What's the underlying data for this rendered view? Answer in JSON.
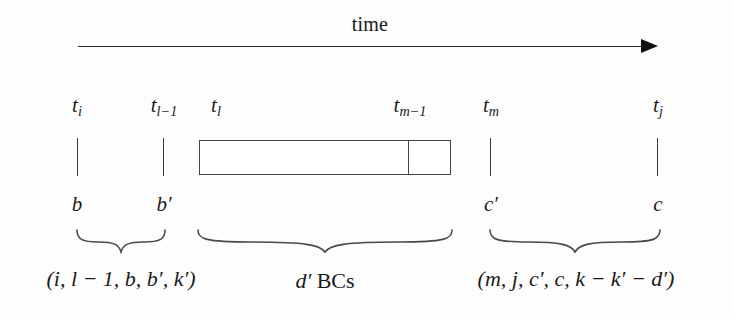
{
  "figure": {
    "kind": "timeline-diagram",
    "background_color": "#fdfdfd",
    "ink_color": "#2b2b2b"
  },
  "axis": {
    "label": "time",
    "direction": "left-to-right",
    "arrow_start_x": 78,
    "arrow_end_x": 658,
    "arrow_y": 46
  },
  "ticks": [
    {
      "id": "ti",
      "top_label": "t",
      "top_sub": "i",
      "bottom_label": "b",
      "bottom_prime": "",
      "x": 77
    },
    {
      "id": "tl1",
      "top_label": "t",
      "top_sub": "l−1",
      "bottom_label": "b",
      "bottom_prime": "′",
      "x": 163
    },
    {
      "id": "tl",
      "top_label": "t",
      "top_sub": "l",
      "bottom_label": "",
      "bottom_prime": "",
      "x": 210
    },
    {
      "id": "tm1",
      "top_label": "t",
      "top_sub": "m−1",
      "bottom_label": "",
      "bottom_prime": "",
      "x": 408
    },
    {
      "id": "tm",
      "top_label": "t",
      "top_sub": "m",
      "bottom_label": "c",
      "bottom_prime": "′",
      "x": 490
    },
    {
      "id": "tj",
      "top_label": "t",
      "top_sub": "j",
      "bottom_label": "c",
      "bottom_prime": "",
      "x": 657
    }
  ],
  "box": {
    "name": "bc-block",
    "left_x": 199,
    "right_x": 451,
    "top_y": 140,
    "bottom_y": 175,
    "divider_x": 408
  },
  "braces": [
    {
      "id": "brace-left",
      "left_x": 77,
      "right_x": 165,
      "top_y": 230,
      "caption_index": 0
    },
    {
      "id": "brace-middle",
      "left_x": 198,
      "right_x": 452,
      "top_y": 230,
      "caption_index": 1
    },
    {
      "id": "brace-right",
      "left_x": 490,
      "right_x": 660,
      "top_y": 230,
      "caption_index": 2
    }
  ],
  "captions": [
    {
      "id": "caption-left",
      "text": "(i, l − 1, b, b′, k′)",
      "parts": [
        "(",
        "i",
        ", ",
        "l",
        " − 1, ",
        "b",
        ", ",
        "b′",
        ", ",
        "k′",
        ")"
      ],
      "center_x": 121,
      "y": 268
    },
    {
      "id": "caption-middle",
      "text": "d′ BCs",
      "math_part": "d′",
      "roman_part": "BCs",
      "center_x": 325,
      "y": 268
    },
    {
      "id": "caption-right",
      "text": "(m, j, c′, c, k − k′ − d′)",
      "center_x": 576,
      "y": 268
    }
  ]
}
